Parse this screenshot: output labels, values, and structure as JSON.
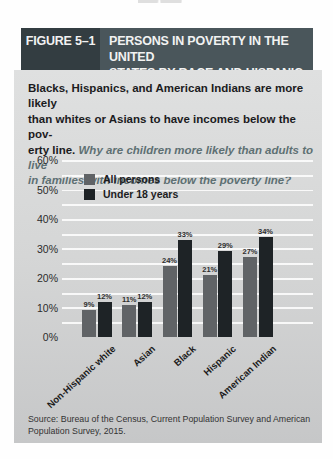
{
  "figure": {
    "header": {
      "label": "FIGURE 5–1",
      "title_lines": [
        "PERSONS IN POVERTY IN THE UNITED",
        "STATES BY RACE AND HISPANIC ORIGIN"
      ]
    },
    "intro_lines": [
      {
        "bold": "Blacks, Hispanics, and American Indians are more likely",
        "italic": ""
      },
      {
        "bold": "than whites or Asians to have incomes below the pov-",
        "italic": ""
      },
      {
        "bold": "erty line. ",
        "italic": "Why are children more likely than adults to live"
      },
      {
        "bold": "",
        "italic": "in families with incomes below the poverty line?"
      }
    ],
    "source_lines": [
      "Source: Bureau of the Census, Current Population Survey and American",
      "Population Survey, 2015."
    ]
  },
  "chart_data": {
    "type": "bar",
    "categories": [
      "Non-Hispanic white",
      "Asian",
      "Black",
      "Hispanic",
      "American Indian"
    ],
    "series": [
      {
        "name": "All persons",
        "color": "#606366",
        "values": [
          9,
          11,
          24,
          21,
          27
        ]
      },
      {
        "name": "Under 18 years",
        "color": "#1e2326",
        "values": [
          12,
          12,
          33,
          29,
          34
        ]
      }
    ],
    "value_labels": [
      [
        "9%",
        "11%",
        "24%",
        "21%",
        "27%"
      ],
      [
        "12%",
        "12%",
        "33%",
        "29%",
        "34%"
      ]
    ],
    "ylim": [
      0,
      60
    ],
    "yticks": [
      0,
      10,
      20,
      30,
      40,
      50,
      60
    ],
    "ytick_suffix": "%",
    "grid": "white horizontal lines every 5%",
    "legend_position": "top-left inside plot",
    "xlabel": "",
    "ylabel": ""
  },
  "colors": {
    "header_label_bg": "#333d41",
    "header_title_bg": "#4a565b",
    "header_text": "#f2f2f2",
    "panel_bg_top": "#dfe0e0",
    "panel_bg_bottom": "#c6c7c8",
    "intro_bold": "#1b1b1d",
    "intro_italic": "#5e7073",
    "bar_all_persons": "#606366",
    "bar_under_18": "#1e2326"
  }
}
